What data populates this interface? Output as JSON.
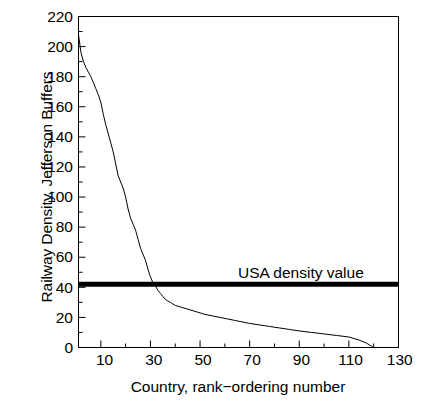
{
  "chart_data": {
    "type": "line",
    "title": "",
    "xlabel": "Country, rank−ordering number",
    "ylabel": "Railway Density, Jefferson Buffers",
    "xlim": [
      1,
      130
    ],
    "ylim": [
      0,
      220
    ],
    "xticks": [
      10,
      30,
      50,
      70,
      90,
      110,
      130
    ],
    "yticks": [
      0,
      20,
      40,
      60,
      80,
      100,
      120,
      140,
      160,
      180,
      200,
      220
    ],
    "grid": false,
    "legend": false,
    "series": [
      {
        "name": "Railway density by country rank",
        "color": "#000000",
        "x": [
          1,
          2,
          3,
          4,
          5,
          6,
          7,
          8,
          9,
          10,
          11,
          12,
          13,
          14,
          15,
          16,
          17,
          18,
          19,
          20,
          21,
          22,
          23,
          24,
          25,
          26,
          27,
          28,
          29,
          30,
          31,
          32,
          33,
          34,
          35,
          36,
          37,
          38,
          39,
          40,
          42,
          44,
          46,
          48,
          50,
          52,
          55,
          58,
          61,
          64,
          67,
          70,
          74,
          78,
          82,
          86,
          90,
          95,
          100,
          105,
          110,
          114,
          117,
          119,
          120
        ],
        "y": [
          208,
          196,
          190,
          186,
          183,
          180,
          176,
          172,
          168,
          163,
          155,
          148,
          142,
          136,
          130,
          122,
          114,
          110,
          106,
          100,
          92,
          86,
          82,
          78,
          72,
          66,
          62,
          58,
          52,
          47,
          43,
          41,
          38,
          36,
          34,
          32,
          31,
          30,
          29,
          28,
          27,
          26,
          25,
          24,
          23,
          22,
          21,
          20,
          19,
          18,
          17,
          16,
          15,
          14,
          13,
          12,
          11,
          10,
          9,
          8,
          7,
          5,
          3,
          1,
          0
        ]
      }
    ],
    "reference_lines": [
      {
        "name": "usa-density-line",
        "label": "USA density value",
        "orientation": "horizontal",
        "value": 42,
        "color": "#000000",
        "thickness": 5
      }
    ]
  }
}
